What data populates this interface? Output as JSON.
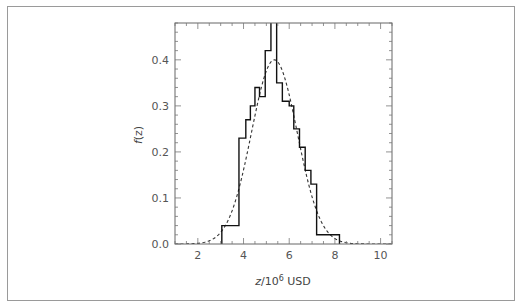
{
  "chart_data": {
    "type": "bar",
    "title": "",
    "xlabel": "z/10^6 USD",
    "xlabel_parts": {
      "var": "z",
      "base": "/10",
      "exp": "6",
      "unit": " USD"
    },
    "ylabel": "f(z)",
    "ylabel_parts": {
      "var": "f",
      "arg": "(z)"
    },
    "xlim": [
      1,
      10.5
    ],
    "ylim": [
      0,
      0.48
    ],
    "xticks": [
      2,
      4,
      6,
      8,
      10
    ],
    "xtick_labels": [
      "2",
      "4",
      "6",
      "8",
      "10"
    ],
    "yticks": [
      0.0,
      0.1,
      0.2,
      0.3,
      0.4
    ],
    "ytick_labels": [
      "0.0",
      "0.1",
      "0.2",
      "0.3",
      "0.4"
    ],
    "grid": false,
    "legend": null,
    "series": [
      {
        "name": "histogram",
        "style": "step",
        "bin_edges": [
          3.05,
          3.8,
          4.1,
          4.3,
          4.5,
          4.7,
          4.95,
          5.2,
          5.45,
          5.7,
          6.0,
          6.2,
          6.45,
          6.7,
          6.95,
          7.2,
          8.2
        ],
        "values": [
          0.04,
          0.23,
          0.27,
          0.3,
          0.34,
          0.32,
          0.42,
          0.49,
          0.35,
          0.31,
          0.3,
          0.25,
          0.21,
          0.16,
          0.13,
          0.02
        ]
      },
      {
        "name": "normal fit",
        "style": "dashed",
        "type": "line",
        "mean": 5.35,
        "std": 1.0,
        "peak": 0.4
      }
    ]
  }
}
